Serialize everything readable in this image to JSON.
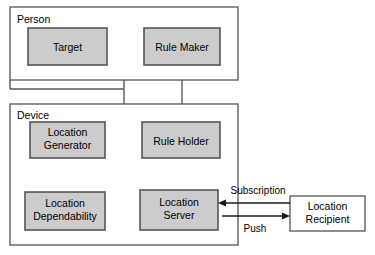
{
  "diagram": {
    "background_color": "#ffffff",
    "node_fill_color": "#cccccc",
    "node_stroke_color": "#555555",
    "group_stroke_color": "#606060",
    "arrow_color": "#1b1b1b",
    "groups": [
      {
        "id": "person",
        "label": "Person"
      },
      {
        "id": "device",
        "label": "Device"
      }
    ],
    "nodes": [
      {
        "id": "target",
        "label": "Target",
        "group": "person",
        "style": "shaded"
      },
      {
        "id": "rule_maker",
        "label": "Rule Maker",
        "group": "person",
        "style": "shaded"
      },
      {
        "id": "location_generator",
        "label_line1": "Location",
        "label_line2": "Generator",
        "group": "device",
        "style": "shaded"
      },
      {
        "id": "rule_holder",
        "label": "Rule Holder",
        "group": "device",
        "style": "shaded"
      },
      {
        "id": "location_dependability",
        "label_line1": "Location",
        "label_line2": "Dependability",
        "group": "device",
        "style": "shaded"
      },
      {
        "id": "location_server",
        "label_line1": "Location",
        "label_line2": "Server",
        "group": "device",
        "style": "shaded"
      },
      {
        "id": "location_recipient",
        "label_line1": "Location",
        "label_line2": "Recipient",
        "group": "external",
        "style": "plain"
      }
    ],
    "edge_labels": {
      "subscription": "Subscription",
      "push": "Push"
    },
    "edges": [
      {
        "from": "target",
        "to": "location_generator",
        "label": ""
      },
      {
        "from": "rule_maker",
        "to": "rule_holder",
        "label": ""
      },
      {
        "from": "location_generator",
        "to": "location_dependability",
        "label": ""
      },
      {
        "from": "location_generator",
        "to": "location_server",
        "label": ""
      },
      {
        "from": "rule_holder",
        "to": "location_server",
        "label": ""
      },
      {
        "from": "location_dependability",
        "to": "location_server",
        "label": ""
      },
      {
        "from": "location_recipient",
        "to": "location_server",
        "label": "Subscription",
        "direction": "left"
      },
      {
        "from": "location_server",
        "to": "location_recipient",
        "label": "Push",
        "direction": "right"
      }
    ]
  }
}
